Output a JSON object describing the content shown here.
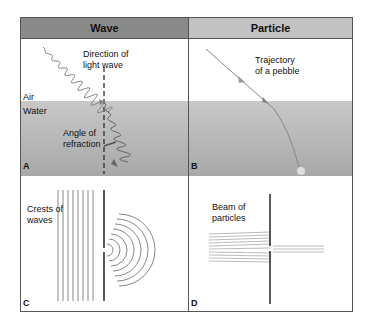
{
  "headers": {
    "wave": "Wave",
    "particle": "Particle"
  },
  "panels": {
    "a": {
      "letter": "A",
      "direction_line1": "Direction of",
      "direction_line2": "light wave",
      "air": "Air",
      "water": "Water",
      "angle_line1": "Angle of",
      "angle_line2": "refraction"
    },
    "b": {
      "letter": "B",
      "trajectory_line1": "Trajectory",
      "trajectory_line2": "of a pebble"
    },
    "c": {
      "letter": "C",
      "crests_line1": "Crests of",
      "crests_line2": "waves"
    },
    "d": {
      "letter": "D",
      "beam_line1": "Beam of",
      "beam_line2": "particles"
    }
  },
  "colors": {
    "header_wave": "#8a8a8a",
    "header_particle": "#c2c2c2",
    "water": "#b5b5b5",
    "border": "#555555"
  }
}
